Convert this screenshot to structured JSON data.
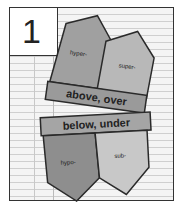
{
  "page_number": "1",
  "top_flap": {
    "left_label": "hyper-",
    "right_label": "super-",
    "banner": "above, over"
  },
  "bottom_flap": {
    "banner": "below, under",
    "left_label": "hypo-",
    "right_label": "sub-"
  },
  "colors": {
    "paper": "#f4f4f4",
    "pencil_dark": "#8a8a8a",
    "pencil_mid": "#a8a8a8",
    "pencil_light": "#c8c8c8",
    "outline": "#2a2a2a"
  }
}
